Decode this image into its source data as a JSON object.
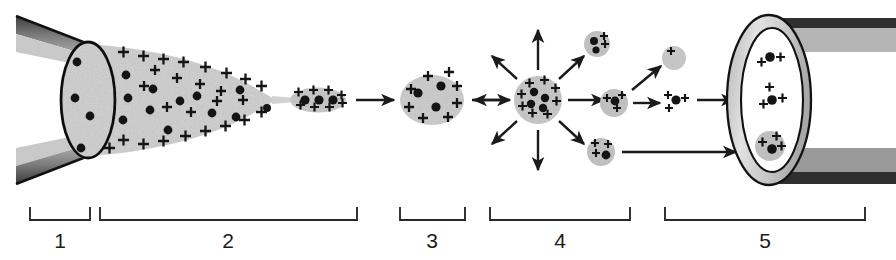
{
  "figure": {
    "background_color": "#ffffff",
    "ink_color": "#1b1b1b",
    "droplet_fill": "#d2d2d2",
    "droplet_fill_dark": "#c4c4c4",
    "tube_wall_dark": "#6e6e6e",
    "tube_wall_light": "#bcbcbc",
    "ring_fill": "#cfcfcf",
    "charge_glyph": "+",
    "analyte_glyph": "dot"
  },
  "brackets": [
    {
      "label": "1",
      "x1": 30,
      "x2": 90,
      "label_x": 60
    },
    {
      "label": "2",
      "x1": 100,
      "x2": 357,
      "label_x": 228
    },
    {
      "label": "3",
      "x1": 400,
      "x2": 465,
      "label_x": 432
    },
    {
      "label": "4",
      "x1": 490,
      "x2": 630,
      "label_x": 560
    },
    {
      "label": "5",
      "x1": 665,
      "x2": 865,
      "label_x": 765
    }
  ],
  "stages": [
    {
      "id": 1,
      "name": "capillary-tip"
    },
    {
      "id": 2,
      "name": "taylor-cone-and-jet"
    },
    {
      "id": 3,
      "name": "charged-droplet"
    },
    {
      "id": 4,
      "name": "coulombic-fission"
    },
    {
      "id": 5,
      "name": "mass-spectrometer-inlet"
    }
  ],
  "geometry": {
    "needle": {
      "top_outer": [
        [
          18,
          18
        ],
        [
          100,
          52
        ]
      ],
      "bottom_outer": [
        [
          18,
          182
        ],
        [
          100,
          148
        ]
      ],
      "tip_ellipse": {
        "cx": 88,
        "cy": 100,
        "rx": 27,
        "ry": 58
      }
    },
    "cone": {
      "apex_x": 276,
      "apex_y": 100,
      "base_x": 95,
      "top_y": 45,
      "bottom_y": 158
    },
    "jet": {
      "x1": 276,
      "x2": 292,
      "y": 100
    },
    "jet_droplet": {
      "cx": 318,
      "cy": 100,
      "rx": 27,
      "ry": 12
    },
    "droplet3": {
      "cx": 432,
      "cy": 100,
      "rx": 31,
      "ry": 24
    },
    "droplet4": {
      "cx": 538,
      "cy": 100,
      "r": 23
    },
    "fragments": [
      {
        "cx": 597,
        "cy": 44,
        "r": 12,
        "pluses": 2,
        "dots": 2
      },
      {
        "cx": 674,
        "cy": 58,
        "r": 11,
        "pluses": 1,
        "dots": 0
      },
      {
        "cx": 614,
        "cy": 103,
        "r": 13,
        "pluses": 3,
        "dots": 1
      },
      {
        "cx": 676,
        "cy": 103,
        "r": 0,
        "pluses": 3,
        "dots": 1
      },
      {
        "cx": 601,
        "cy": 152,
        "r": 13,
        "pluses": 3,
        "dots": 1
      }
    ],
    "inlet": {
      "cx": 769,
      "cy": 100,
      "outer_rx": 41,
      "outer_ry": 84,
      "inner_rx": 31,
      "inner_ry": 72,
      "ions": [
        {
          "cx": 769,
          "cy": 58,
          "type": "bare-ion"
        },
        {
          "cx": 772,
          "cy": 100,
          "type": "bare-ion"
        },
        {
          "cx": 770,
          "cy": 146,
          "type": "droplet-ion"
        }
      ]
    },
    "arrows_inline": [
      {
        "x1": 356,
        "x2": 396,
        "y": 100
      },
      {
        "x1": 472,
        "x2": 512,
        "y": 100
      },
      {
        "x1": 636,
        "x2": 660,
        "y": 100
      },
      {
        "x1": 694,
        "x2": 736,
        "y": 100
      },
      {
        "x1": 622,
        "x2": 736,
        "y": 152
      }
    ],
    "explosion_arrows": {
      "cx": 538,
      "cy": 100,
      "r_in": 30,
      "r_out": 62,
      "count": 8
    },
    "diagonal_arrow": {
      "x1": 632,
      "y1": 88,
      "x2": 660,
      "y2": 66
    }
  }
}
